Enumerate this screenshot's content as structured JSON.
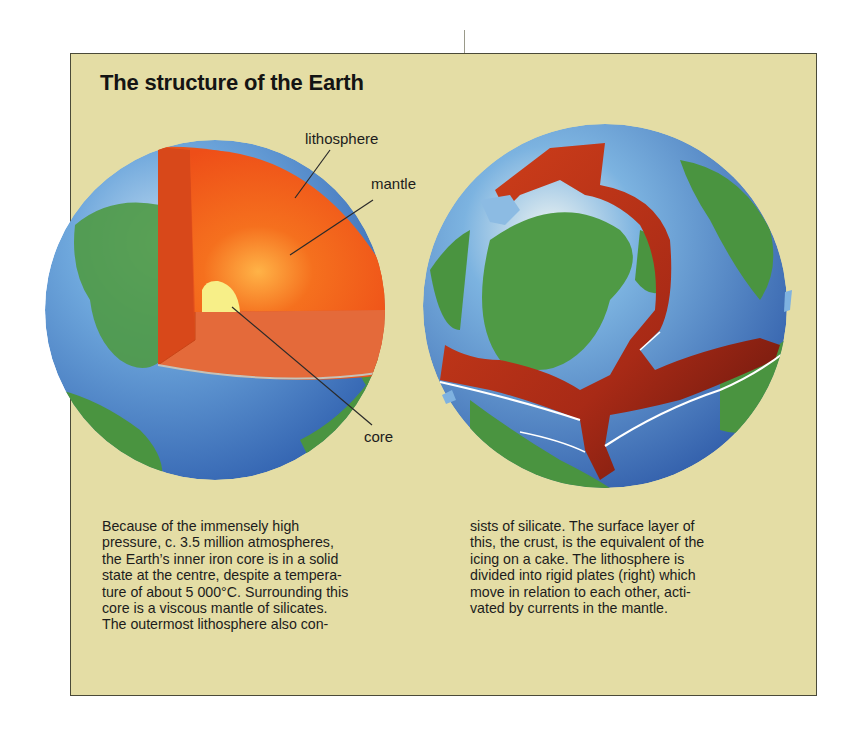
{
  "title": "The structure of the Earth",
  "labels": {
    "lithosphere": "lithosphere",
    "mantle": "mantle",
    "core": "core"
  },
  "figures": {
    "left": "cutaway-earth-layers",
    "right": "earth-lithospheric-plates"
  },
  "text": {
    "left_column": [
      "Because of the immensely high",
      "pressure, c. 3.5 million atmospheres,",
      "the Earth’s inner iron core is in a solid",
      "state at the centre, despite a tempera-",
      "ture of about 5 000°C. Surrounding this",
      "core is a viscous mantle of silicates.",
      "The outermost lithosphere also con-"
    ],
    "right_column": [
      "sists of silicate. The surface layer of",
      "this, the crust, is the equivalent of the",
      "icing on a cake. The lithosphere is",
      "divided into rigid plates (right) which",
      "move in relation to each other, acti-",
      "vated by currents in the mantle."
    ]
  },
  "colors": {
    "panel": "#e4dda5",
    "ocean": "#5b95cf",
    "land": "#4a9440",
    "mantle": "#f05a1e",
    "core": "#f6ee86",
    "plate_boundary": "#b8321a"
  }
}
